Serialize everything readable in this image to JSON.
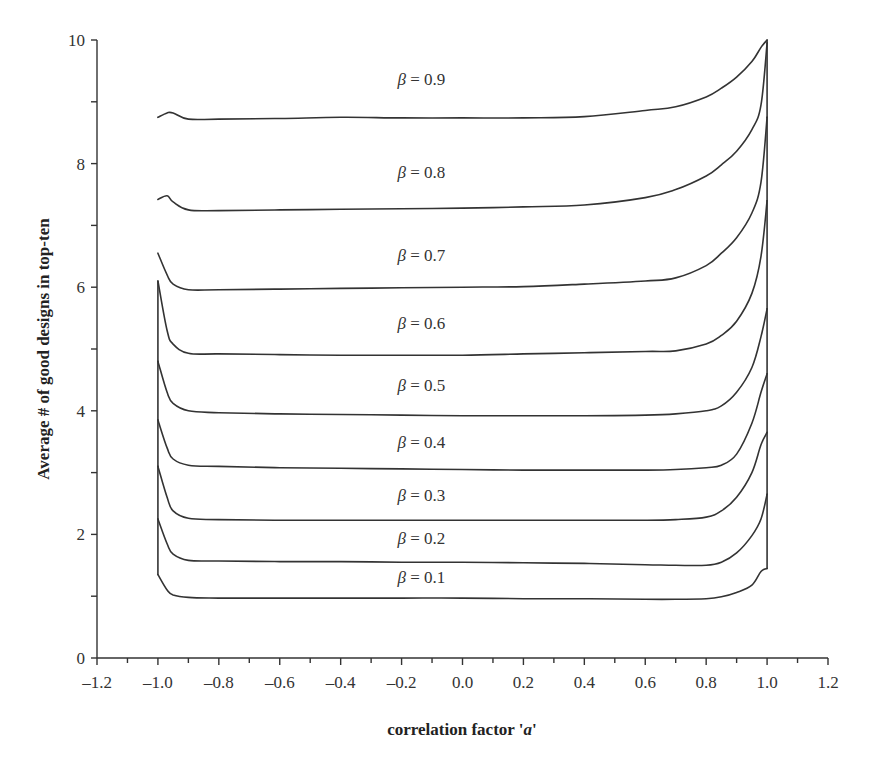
{
  "chart_data": {
    "type": "line",
    "title": "",
    "xlabel": "correlation factor 'a'",
    "xlabel_parts": {
      "main": "correlation factor '",
      "var": "a",
      "end": "'"
    },
    "ylabel": "Average # of good designs in top-ten",
    "xlim": [
      -1.2,
      1.2
    ],
    "ylim": [
      0,
      10
    ],
    "x_ticks": [
      "-1.2",
      "-1.0",
      "-0.8",
      "-0.6",
      "-0.4",
      "-0.2",
      "0.0",
      "0.2",
      "0.4",
      "0.6",
      "0.8",
      "1.0",
      "1.2"
    ],
    "x_tick_values": [
      -1.2,
      -1.0,
      -0.8,
      -0.6,
      -0.4,
      -0.2,
      0.0,
      0.2,
      0.4,
      0.6,
      0.8,
      1.0,
      1.2
    ],
    "y_ticks": [
      "0",
      "2",
      "4",
      "6",
      "8",
      "10"
    ],
    "y_tick_values": [
      0,
      2,
      4,
      6,
      8,
      10
    ],
    "grid": false,
    "legend": "inline labels above curves",
    "x": [
      -1.0,
      -0.97,
      -0.95,
      -0.9,
      -0.8,
      -0.6,
      -0.4,
      -0.2,
      0.0,
      0.2,
      0.4,
      0.6,
      0.7,
      0.8,
      0.85,
      0.9,
      0.95,
      0.98,
      1.0
    ],
    "series": [
      {
        "name": "β = 0.9",
        "label_value": "0.9",
        "values": [
          8.75,
          8.82,
          8.82,
          8.72,
          8.72,
          8.73,
          8.75,
          8.74,
          8.74,
          8.74,
          8.76,
          8.86,
          8.92,
          9.08,
          9.22,
          9.4,
          9.65,
          9.88,
          10.0
        ]
      },
      {
        "name": "β = 0.8",
        "label_value": "0.8",
        "values": [
          7.42,
          7.48,
          7.38,
          7.25,
          7.24,
          7.25,
          7.26,
          7.27,
          7.28,
          7.3,
          7.33,
          7.45,
          7.58,
          7.8,
          7.98,
          8.2,
          8.55,
          8.95,
          9.95
        ]
      },
      {
        "name": "β = 0.7",
        "label_value": "0.7",
        "values": [
          6.55,
          6.2,
          6.05,
          5.96,
          5.96,
          5.97,
          5.98,
          5.99,
          6.0,
          6.01,
          6.05,
          6.1,
          6.15,
          6.35,
          6.55,
          6.8,
          7.2,
          7.7,
          8.75
        ]
      },
      {
        "name": "β = 0.6",
        "label_value": "0.6",
        "values": [
          6.1,
          5.3,
          5.08,
          4.93,
          4.92,
          4.91,
          4.9,
          4.9,
          4.9,
          4.92,
          4.94,
          4.96,
          4.97,
          5.08,
          5.22,
          5.45,
          5.9,
          6.5,
          7.4
        ]
      },
      {
        "name": "β = 0.5",
        "label_value": "0.5",
        "values": [
          4.8,
          4.3,
          4.12,
          4.0,
          3.97,
          3.95,
          3.94,
          3.93,
          3.92,
          3.92,
          3.92,
          3.93,
          3.95,
          4.0,
          4.08,
          4.3,
          4.7,
          5.2,
          5.65
        ]
      },
      {
        "name": "β = 0.4",
        "label_value": "0.4",
        "values": [
          3.85,
          3.4,
          3.22,
          3.12,
          3.1,
          3.08,
          3.07,
          3.06,
          3.05,
          3.04,
          3.04,
          3.04,
          3.05,
          3.08,
          3.12,
          3.3,
          3.8,
          4.3,
          4.6
        ]
      },
      {
        "name": "β = 0.3",
        "label_value": "0.3",
        "values": [
          3.1,
          2.6,
          2.38,
          2.26,
          2.24,
          2.23,
          2.23,
          2.23,
          2.23,
          2.23,
          2.23,
          2.23,
          2.24,
          2.28,
          2.38,
          2.6,
          3.0,
          3.45,
          3.65
        ]
      },
      {
        "name": "β = 0.2",
        "label_value": "0.2",
        "values": [
          2.25,
          1.85,
          1.68,
          1.58,
          1.57,
          1.56,
          1.56,
          1.55,
          1.55,
          1.54,
          1.53,
          1.51,
          1.5,
          1.5,
          1.55,
          1.7,
          1.98,
          2.25,
          2.65
        ]
      },
      {
        "name": "β = 0.1",
        "label_value": "0.1",
        "values": [
          1.35,
          1.1,
          1.02,
          0.98,
          0.97,
          0.97,
          0.97,
          0.97,
          0.97,
          0.96,
          0.96,
          0.95,
          0.95,
          0.96,
          0.99,
          1.06,
          1.18,
          1.4,
          1.45
        ]
      }
    ],
    "curve_labels": [
      {
        "text_beta": "β",
        "text_eq": " = 0.9",
        "x": 0.0,
        "y": 9.35
      },
      {
        "text_beta": "β",
        "text_eq": " = 0.8",
        "x": 0.0,
        "y": 7.85
      },
      {
        "text_beta": "β",
        "text_eq": " = 0.7",
        "x": 0.0,
        "y": 6.5
      },
      {
        "text_beta": "β",
        "text_eq": " = 0.6",
        "x": 0.0,
        "y": 5.4
      },
      {
        "text_beta": "β",
        "text_eq": " = 0.5",
        "x": 0.0,
        "y": 4.4
      },
      {
        "text_beta": "β",
        "text_eq": " = 0.4",
        "x": 0.0,
        "y": 3.48
      },
      {
        "text_beta": "β",
        "text_eq": " = 0.3",
        "x": 0.0,
        "y": 2.62
      },
      {
        "text_beta": "β",
        "text_eq": " = 0.2",
        "x": 0.0,
        "y": 1.93
      },
      {
        "text_beta": "β",
        "text_eq": " = 0.1",
        "x": 0.0,
        "y": 1.3
      }
    ]
  },
  "colors": {
    "line": "#333333",
    "background": "#ffffff",
    "text": "#333333"
  }
}
